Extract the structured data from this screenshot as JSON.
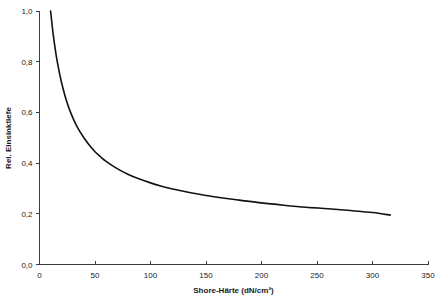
{
  "chart_data": {
    "type": "line",
    "title": "",
    "xlabel": "Shore-Härte (dN/cm²)",
    "ylabel": "Rel. Einsinktiefe",
    "xlim": [
      0,
      350
    ],
    "ylim": [
      0.0,
      1.0
    ],
    "grid": false,
    "legend": "none",
    "xticks": [
      0,
      50,
      100,
      150,
      200,
      250,
      300,
      350
    ],
    "xtick_labels": [
      "0",
      "50",
      "100",
      "150",
      "200",
      "250",
      "300",
      "350"
    ],
    "yticks": [
      0.0,
      0.2,
      0.4,
      0.6,
      0.8,
      1.0
    ],
    "ytick_labels": [
      "0,0",
      "0,2",
      "0,4",
      "0,6",
      "0,8",
      "1,0"
    ],
    "series": [
      {
        "name": "Rel. Einsinktiefe",
        "color": "#111111",
        "x": [
          10,
          12,
          14,
          16,
          18,
          20,
          24,
          28,
          32,
          36,
          40,
          45,
          50,
          55,
          60,
          70,
          80,
          90,
          100,
          110,
          120,
          135,
          150,
          165,
          180,
          200,
          220,
          240,
          260,
          280,
          300,
          316
        ],
        "y": [
          1.0,
          0.92,
          0.855,
          0.8,
          0.755,
          0.715,
          0.65,
          0.6,
          0.56,
          0.527,
          0.5,
          0.47,
          0.445,
          0.425,
          0.407,
          0.378,
          0.355,
          0.337,
          0.322,
          0.309,
          0.298,
          0.284,
          0.272,
          0.262,
          0.254,
          0.243,
          0.234,
          0.226,
          0.22,
          0.213,
          0.205,
          0.195
        ]
      }
    ]
  },
  "axes": {
    "y_title": "Rel. Einsinktiefe",
    "x_title": "Shore-Härte (dN/cm²)"
  }
}
